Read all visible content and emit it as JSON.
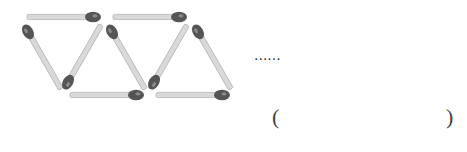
{
  "figure": {
    "match_count_visible": 9,
    "triangle_count_visible": 4,
    "colors": {
      "stick": "#d9d9d9",
      "stick_edge": "#b5b5b5",
      "head": "#555555",
      "head_highlight": "#8a8a8a"
    }
  },
  "ellipsis": "......",
  "answer": {
    "open_paren": "(",
    "value": "",
    "close_paren": ")"
  }
}
